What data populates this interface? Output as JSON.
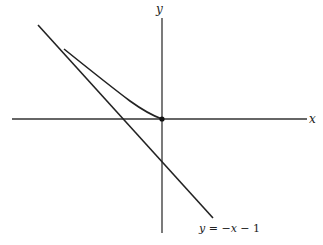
{
  "diagram": {
    "axes": {
      "x_label": "x",
      "y_label": "y"
    },
    "curve": {
      "description": "curve from upper-left ending at origin"
    },
    "line": {
      "label": "y = −x − 1",
      "label_y": "y",
      "label_rest": " = −",
      "label_x": "x",
      "label_tail": " − 1"
    },
    "origin_point": "(0, 0)",
    "colors": {
      "stroke": "#222222",
      "axis": "#333333",
      "background": "#ffffff"
    }
  }
}
